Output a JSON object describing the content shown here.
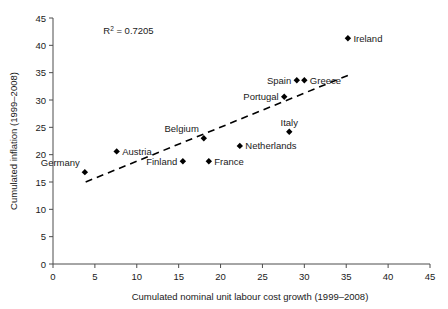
{
  "chart_data": {
    "type": "scatter",
    "title": "",
    "xlabel": "Cumulated nominal unit labour cost growth (1999–2008)",
    "ylabel": "Cumulated inflation (1999–2008)",
    "xlim": [
      0,
      45
    ],
    "ylim": [
      0,
      45
    ],
    "xticks": [
      0,
      5,
      10,
      15,
      20,
      25,
      30,
      35,
      40,
      45
    ],
    "yticks": [
      0,
      5,
      10,
      15,
      20,
      25,
      30,
      35,
      40,
      45
    ],
    "grid": false,
    "legend": "none",
    "annotations": [
      {
        "name": "r-squared",
        "text_prefix": "R",
        "text_sup": "2",
        "text_suffix": " = 0.7205",
        "x": 6.0,
        "y": 42.0
      }
    ],
    "trendline": {
      "style": "dashed",
      "x0": 3.9,
      "y0": 15.0,
      "x1": 35.2,
      "y1": 34.5
    },
    "points": [
      {
        "label": "Germany",
        "x": 3.8,
        "y": 16.8,
        "label_pos": "left-above"
      },
      {
        "label": "Austria",
        "x": 7.6,
        "y": 20.6,
        "label_pos": "right"
      },
      {
        "label": "Finland",
        "x": 15.5,
        "y": 18.8,
        "label_pos": "left"
      },
      {
        "label": "Belgium",
        "x": 18.0,
        "y": 23.0,
        "label_pos": "left-above"
      },
      {
        "label": "France",
        "x": 18.6,
        "y": 18.8,
        "label_pos": "right"
      },
      {
        "label": "Netherlands",
        "x": 22.3,
        "y": 21.6,
        "label_pos": "right"
      },
      {
        "label": "Italy",
        "x": 28.2,
        "y": 24.2,
        "label_pos": "above"
      },
      {
        "label": "Portugal",
        "x": 27.6,
        "y": 30.6,
        "label_pos": "left"
      },
      {
        "label": "Spain",
        "x": 29.1,
        "y": 33.6,
        "label_pos": "left"
      },
      {
        "label": "Greece",
        "x": 30.0,
        "y": 33.6,
        "label_pos": "right"
      },
      {
        "label": "Ireland",
        "x": 35.2,
        "y": 41.3,
        "label_pos": "right"
      }
    ]
  },
  "colors": {
    "marker": "#000000",
    "axis": "#4d4d4d",
    "text": "#1a1a1a",
    "background": "#ffffff"
  }
}
